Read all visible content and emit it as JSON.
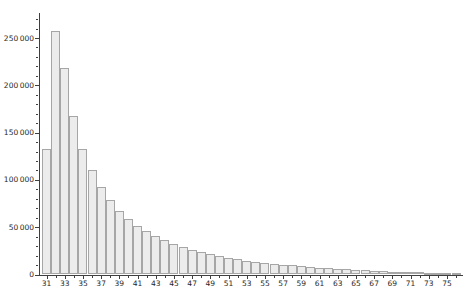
{
  "chart_data": {
    "type": "bar",
    "title": "",
    "xlabel": "",
    "ylabel": "",
    "grid": false,
    "legend": false,
    "categories": [
      31,
      32,
      33,
      34,
      35,
      36,
      37,
      38,
      39,
      40,
      41,
      42,
      43,
      44,
      45,
      46,
      47,
      48,
      49,
      50,
      51,
      52,
      53,
      54,
      55,
      56,
      57,
      58,
      59,
      60,
      61,
      62,
      63,
      64,
      65,
      66,
      67,
      68,
      69,
      70,
      71,
      72,
      73,
      74,
      75,
      76
    ],
    "values": [
      133000,
      257000,
      218000,
      168000,
      133000,
      110000,
      93000,
      79000,
      67500,
      58500,
      51500,
      45500,
      40500,
      36000,
      32000,
      28800,
      26000,
      23500,
      21300,
      19300,
      17600,
      16000,
      14700,
      13600,
      12600,
      11500,
      10500,
      9600,
      8800,
      8000,
      7300,
      6600,
      6000,
      5400,
      4900,
      4400,
      3900,
      3500,
      3100,
      2800,
      2500,
      2200,
      1900,
      1700,
      1500,
      1300
    ],
    "xlim": [
      30.5,
      76.5
    ],
    "ylim": [
      0,
      265000
    ],
    "x_tick_labels": [
      "31",
      "33",
      "35",
      "37",
      "39",
      "41",
      "43",
      "45",
      "47",
      "49",
      "51",
      "53",
      "55",
      "57",
      "59",
      "61",
      "63",
      "65",
      "67",
      "69",
      "71",
      "73",
      "75"
    ],
    "y_ticks": [
      {
        "value": 0,
        "label": "0"
      },
      {
        "value": 50000,
        "label": "50 000"
      },
      {
        "value": 100000,
        "label": "100 000"
      },
      {
        "value": 150000,
        "label": "150 000"
      },
      {
        "value": 200000,
        "label": "200 000"
      },
      {
        "value": 250000,
        "label": "250 000"
      }
    ],
    "y_minor_step": 10000,
    "y_max_minor": 270000,
    "bar_fill": "#ececec",
    "bar_border": "#a6a6a6",
    "axis_color": "#3f3f3f",
    "label_color": "#1f1f1f",
    "background": "#ffffff"
  }
}
